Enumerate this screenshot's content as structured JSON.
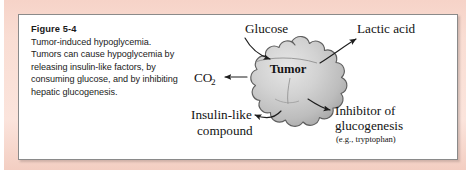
{
  "figure": {
    "caption": {
      "title": "Figure 5-4",
      "body": "Tumor-induced hypoglycemia. Tumors can cause hypoglycemia by releasing insulin-like factors, by consuming glucose, and by inhibiting hepatic glucogenesis."
    },
    "diagram": {
      "center_label": "Tumor",
      "labels": {
        "glucose": "Glucose",
        "lactic_acid": "Lactic acid",
        "co2_main": "CO",
        "co2_subscript": "2",
        "insulin_line1": "Insulin-like",
        "insulin_line2": "compound",
        "inhibitor_line1": "Inhibitor of",
        "inhibitor_line2": "glucogenesis",
        "inhibitor_line3": "(e.g., tryptophan)"
      },
      "arrows": [
        {
          "name": "glucose-arrow",
          "direction": "into-tumor",
          "from": "Glucose",
          "to": "Tumor"
        },
        {
          "name": "lactic-acid-arrow",
          "direction": "out-of-tumor",
          "from": "Tumor",
          "to": "Lactic acid"
        },
        {
          "name": "co2-arrow",
          "direction": "out-of-tumor",
          "from": "Tumor",
          "to": "CO2"
        },
        {
          "name": "insulin-like-arrow",
          "direction": "out-of-tumor",
          "from": "Tumor",
          "to": "Insulin-like compound"
        },
        {
          "name": "inhibitor-arrow",
          "direction": "out-of-tumor",
          "from": "Tumor",
          "to": "Inhibitor of glucogenesis"
        }
      ]
    },
    "colors": {
      "band_pink": "#f8dcd2",
      "panel_background": "#ffffff",
      "panel_border": "#8a8a8a",
      "tumor_fill": "#c9c9c9",
      "tumor_outline": "#5a5a5a",
      "text": "#1a1a1a"
    }
  }
}
